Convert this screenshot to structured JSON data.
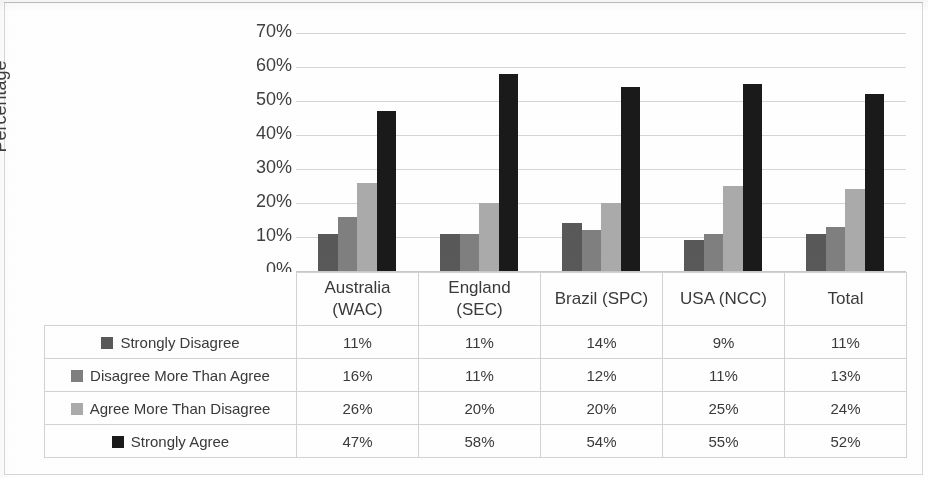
{
  "chart_data": {
    "type": "bar",
    "title": "",
    "xlabel": "",
    "ylabel": "Percentage",
    "ylim": [
      0,
      70
    ],
    "ytick_labels": [
      "0%",
      "10%",
      "20%",
      "30%",
      "40%",
      "50%",
      "60%",
      "70%"
    ],
    "ytick_values": [
      0,
      10,
      20,
      30,
      40,
      50,
      60,
      70
    ],
    "grid": true,
    "legend_position": "data-table-below",
    "categories": [
      "Australia (WAC)",
      "England (SEC)",
      "Brazil (SPC)",
      "USA (NCC)",
      "Total"
    ],
    "category_lines": [
      [
        "Australia",
        "(WAC)"
      ],
      [
        "England",
        "(SEC)"
      ],
      [
        "Brazil (SPC)"
      ],
      [
        "USA (NCC)"
      ],
      [
        "Total"
      ]
    ],
    "series": [
      {
        "name": "Strongly Disagree",
        "color": "#595959",
        "values": [
          11,
          11,
          14,
          9,
          11
        ],
        "labels": [
          "11%",
          "11%",
          "14%",
          "9%",
          "11%"
        ]
      },
      {
        "name": "Disagree More Than Agree",
        "color": "#808080",
        "values": [
          16,
          11,
          12,
          11,
          13
        ],
        "labels": [
          "16%",
          "11%",
          "12%",
          "11%",
          "13%"
        ]
      },
      {
        "name": "Agree More Than Disagree",
        "color": "#ababab",
        "values": [
          26,
          20,
          20,
          25,
          24
        ],
        "labels": [
          "26%",
          "20%",
          "20%",
          "25%",
          "24%"
        ]
      },
      {
        "name": "Strongly Agree",
        "color": "#1a1a1a",
        "values": [
          47,
          58,
          54,
          55,
          52
        ],
        "labels": [
          "47%",
          "58%",
          "54%",
          "55%",
          "52%"
        ]
      }
    ]
  }
}
